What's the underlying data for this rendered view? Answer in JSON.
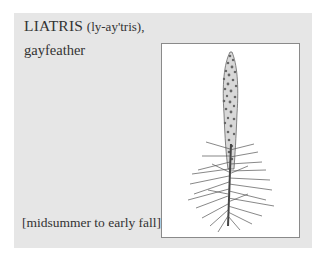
{
  "entry": {
    "genus": "LIATRIS",
    "pronunciation": "(ly-ay'tris),",
    "common_name": "gayfeather",
    "bloom_season": "[midsummer to early fall]"
  },
  "illustration": {
    "subject": "liatris-flower-spike",
    "frame_color": "#8a8a8a",
    "panel_color": "#e6e6e6"
  }
}
